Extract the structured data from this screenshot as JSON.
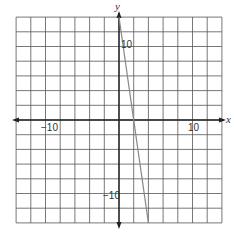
{
  "chart_data": {
    "type": "line",
    "title": "",
    "xlabel": "x",
    "ylabel": "y",
    "xlim": [
      -14,
      14
    ],
    "ylim": [
      -14,
      14
    ],
    "grid": true,
    "grid_step": 2,
    "tick_labels": {
      "x": [
        {
          "value": -10,
          "label": "−10"
        },
        {
          "value": 10,
          "label": "10"
        }
      ],
      "y": [
        {
          "value": 10,
          "label": "10"
        },
        {
          "value": -10,
          "label": "−10"
        }
      ]
    },
    "series": [
      {
        "name": "line",
        "equation": "y = -7x + 14",
        "x": [
          0,
          4
        ],
        "y": [
          14,
          -14
        ],
        "color": "#888888"
      }
    ]
  },
  "labels": {
    "x_axis": "x",
    "y_axis": "y",
    "x_neg10": "−10",
    "x_pos10": "10",
    "y_pos10": "10",
    "y_neg10": "−10"
  },
  "colors": {
    "grid": "#555555",
    "axis": "#222222",
    "line": "#888888"
  }
}
